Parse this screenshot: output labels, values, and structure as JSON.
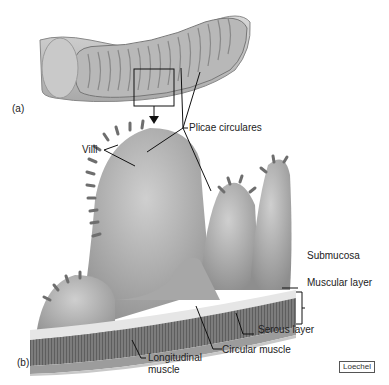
{
  "figure": {
    "panel_a_label": "(a)",
    "panel_b_label": "(b)",
    "labels": {
      "plicae_circulares": "Plicae circulares",
      "villi": "Villi",
      "submucosa": "Submucosa",
      "muscular_layer": "Muscular layer",
      "serous_layer": "Serous layer",
      "circular_muscle": "Circular muscle",
      "longitudinal_muscle_line1": "Longitudinal",
      "longitudinal_muscle_line2": "muscle"
    },
    "credit": "Loechel"
  },
  "colors": {
    "background": "#ffffff",
    "tissue_dark": "#7a7a7a",
    "tissue_mid": "#a8a8a8",
    "tissue_light": "#d6d6d6",
    "leader_line": "#111111"
  }
}
